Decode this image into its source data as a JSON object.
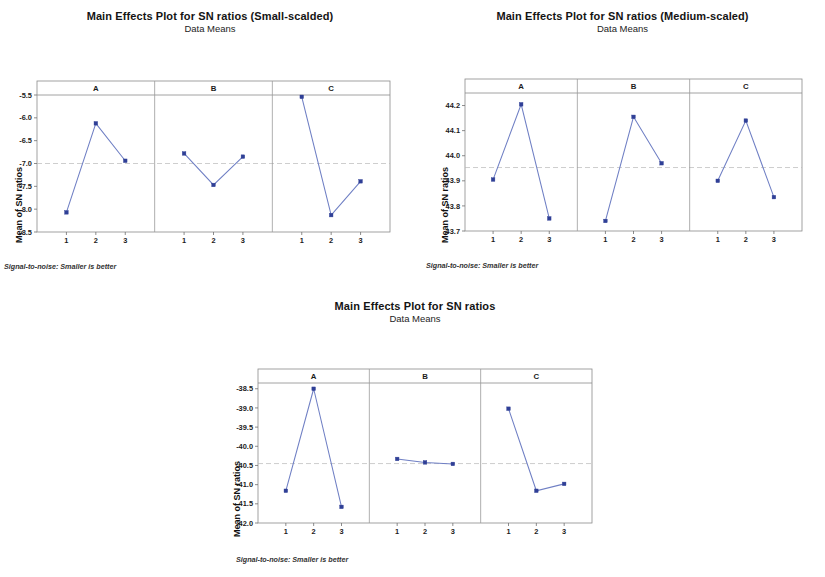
{
  "figures": [
    {
      "id": "fig1",
      "title": "Main Effects Plot for SN ratios (Small-scalded)",
      "subtitle": "Data Means",
      "ylabel": "Mean of SN ratios",
      "footnote": "Signal-to-noise: Smaller is better",
      "chart_data": {
        "type": "line",
        "title": "Main Effects Plot for SN ratios (Small-scalded)",
        "subtitle": "Data Means",
        "xlabel": "",
        "ylabel": "Mean of SN ratios",
        "ylim": [
          -8.5,
          -5.5
        ],
        "yticks": [
          "-5.5",
          "-6.0",
          "-6.5",
          "-7.0",
          "-7.5",
          "-8.0",
          "-8.5"
        ],
        "ytickvals": [
          -5.5,
          -6.0,
          -6.5,
          -7.0,
          -7.5,
          -8.0,
          -8.5
        ],
        "grid": "reference line at y = -7.0",
        "refline": -7.0,
        "legend": "none",
        "panels": [
          {
            "name": "A",
            "categories": [
              "1",
              "2",
              "3"
            ],
            "values": [
              -8.07,
              -6.12,
              -6.94
            ]
          },
          {
            "name": "B",
            "categories": [
              "1",
              "2",
              "3"
            ],
            "values": [
              -6.78,
              -7.47,
              -6.85
            ]
          },
          {
            "name": "C",
            "categories": [
              "1",
              "2",
              "3"
            ],
            "values": [
              -5.54,
              -8.13,
              -7.39
            ]
          }
        ]
      }
    },
    {
      "id": "fig2",
      "title": "Main Effects Plot for SN ratios (Medium-scaled)",
      "subtitle": "Data Means",
      "ylabel": "Mean of SN ratios",
      "footnote": "Signal-to-noise: Smaller is better",
      "chart_data": {
        "type": "line",
        "title": "Main Effects Plot for SN ratios (Medium-scaled)",
        "subtitle": "Data Means",
        "xlabel": "",
        "ylabel": "Mean of SN ratios",
        "ylim": [
          43.7,
          44.25
        ],
        "yticks": [
          "44.2",
          "44.1",
          "44.0",
          "43.9",
          "43.8",
          "43.7"
        ],
        "ytickvals": [
          44.2,
          44.1,
          44.0,
          43.9,
          43.8,
          43.7
        ],
        "grid": "reference line at y = 43.95",
        "refline": 43.953,
        "legend": "none",
        "panels": [
          {
            "name": "A",
            "categories": [
              "1",
              "2",
              "3"
            ],
            "values": [
              43.905,
              44.205,
              43.75
            ]
          },
          {
            "name": "B",
            "categories": [
              "1",
              "2",
              "3"
            ],
            "values": [
              43.74,
              44.155,
              43.97
            ]
          },
          {
            "name": "C",
            "categories": [
              "1",
              "2",
              "3"
            ],
            "values": [
              43.9,
              44.14,
              43.835
            ]
          }
        ]
      }
    },
    {
      "id": "fig3",
      "title": "Main Effects Plot for SN ratios",
      "subtitle": "Data Means",
      "ylabel": "Mean of SN ratios",
      "footnote": "Signal-to-noise: Smaller is better",
      "chart_data": {
        "type": "line",
        "title": "Main Effects Plot for SN ratios",
        "subtitle": "Data Means",
        "xlabel": "",
        "ylabel": "Mean of SN ratios",
        "ylim": [
          -42.0,
          -38.35
        ],
        "yticks": [
          "-38.5",
          "-39.0",
          "-39.5",
          "-40.0",
          "-40.5",
          "-41.0",
          "-41.5",
          "-42.0"
        ],
        "ytickvals": [
          -38.5,
          -39.0,
          -39.5,
          -40.0,
          -40.5,
          -41.0,
          -41.5,
          -42.0
        ],
        "grid": "reference line at y = -40.45",
        "refline": -40.45,
        "legend": "none",
        "panels": [
          {
            "name": "A",
            "categories": [
              "1",
              "2",
              "3"
            ],
            "values": [
              -41.16,
              -38.5,
              -41.58
            ]
          },
          {
            "name": "B",
            "categories": [
              "1",
              "2",
              "3"
            ],
            "values": [
              -40.33,
              -40.42,
              -40.46
            ]
          },
          {
            "name": "C",
            "categories": [
              "1",
              "2",
              "3"
            ],
            "values": [
              -39.02,
              -41.16,
              -40.98
            ]
          }
        ]
      }
    }
  ],
  "colors": {
    "marker": "#2f3f96",
    "line": "#6f7fc4",
    "frame": "#8a8a8a",
    "refline": "#b9b9b9",
    "text": "#1a1a1a",
    "background": "#ffffff"
  }
}
